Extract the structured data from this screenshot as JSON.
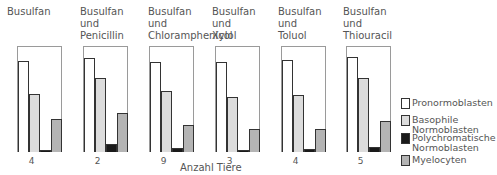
{
  "chart_data": {
    "type": "bar",
    "title": "",
    "xlabel": "Anzahl Tiere",
    "ylabel": "",
    "grid": false,
    "legend_position": "right",
    "categories_per_panel": [
      "Pronormoblasten",
      "Basophile Normoblasten",
      "Polychromatische Normoblasten",
      "Myelocyten"
    ],
    "units": "relative height (%, box height = 100)",
    "ylim": [
      0,
      100
    ],
    "panels": [
      {
        "title": "Busulfan",
        "n": "4",
        "values": [
          86,
          55,
          2,
          31
        ]
      },
      {
        "title": "Busulfan\nund\nPenicillin",
        "n": "2",
        "values": [
          89,
          70,
          8,
          37
        ]
      },
      {
        "title": "Busulfan\nund\nChloramphenicol",
        "n": "9",
        "values": [
          85,
          58,
          4,
          25
        ]
      },
      {
        "title": "Busulfan\nund\nXylol",
        "n": "3",
        "values": [
          85,
          52,
          2,
          22
        ]
      },
      {
        "title": "Busulfan\nund\nToluol",
        "n": "4",
        "values": [
          87,
          54,
          3,
          22
        ]
      },
      {
        "title": "Busulfan\nund\nThiouracil",
        "n": "5",
        "values": [
          90,
          70,
          5,
          29
        ]
      }
    ],
    "series_colors": {
      "Pronormoblasten": "#ffffff",
      "Basophile Normoblasten": "#dcdcdc",
      "Polychromatische Normoblasten": "#1a1a1a",
      "Myelocyten": "#b4b4b4"
    }
  },
  "legend": [
    {
      "label": "Pronormoblasten",
      "color": "#ffffff"
    },
    {
      "label": "Basophile\nNormoblasten",
      "color": "#dcdcdc"
    },
    {
      "label": "Polychromatische\nNormoblasten",
      "color": "#1a1a1a"
    },
    {
      "label": "Myelocyten",
      "color": "#b4b4b4"
    }
  ],
  "xlabel": "Anzahl Tiere"
}
